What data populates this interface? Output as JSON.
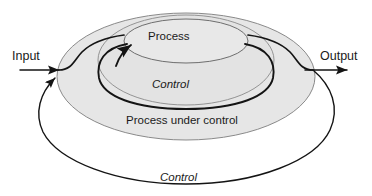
{
  "diagram": {
    "colors": {
      "shaded_fill": "#e6e6e6",
      "shape_stroke": "#7a7a7a",
      "flow_stroke": "#1a1a1a",
      "background": "#ffffff",
      "text": "#1a1a1a"
    },
    "labels": {
      "input": "Input",
      "output": "Output",
      "process": "Process",
      "control_inner": "Control",
      "process_under_control": "Process under control",
      "control_outer": "Control"
    },
    "shapes": [
      {
        "name": "process-under-control-ellipse",
        "label": "Process under control",
        "shaded": true
      },
      {
        "name": "control-loop-ellipse",
        "label": "Control",
        "shaded": true
      },
      {
        "name": "process-ellipse",
        "label": "Process",
        "shaded": true
      }
    ],
    "flows": [
      {
        "name": "input-arrow",
        "from": "Input",
        "to": "Process under control",
        "arrow": true
      },
      {
        "name": "input-to-process-curve",
        "from": "input junction",
        "to": "Process",
        "arrow": false
      },
      {
        "name": "process-to-output-curve",
        "from": "Process",
        "to": "output junction",
        "arrow": false
      },
      {
        "name": "output-arrow",
        "from": "Process under control",
        "to": "Output",
        "arrow": true
      },
      {
        "name": "control-feedback-inner",
        "from": "Control",
        "to": "Process",
        "arrow": true
      },
      {
        "name": "control-feedback-outer",
        "from": "Output",
        "to": "Input",
        "arrow": true
      }
    ]
  }
}
